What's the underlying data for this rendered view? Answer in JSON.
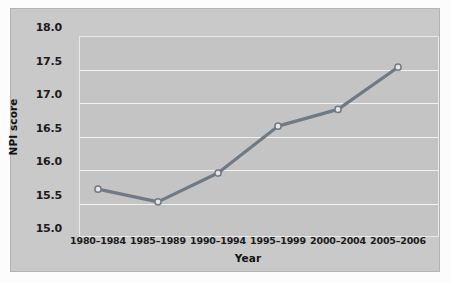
{
  "chart_data": {
    "type": "line",
    "title": "",
    "xlabel": "Year",
    "ylabel": "NPI score",
    "categories": [
      "1980–1984",
      "1985–1989",
      "1990–1994",
      "1995–1999",
      "2000–2004",
      "2005–2006"
    ],
    "values": [
      15.58,
      15.39,
      15.82,
      16.52,
      16.77,
      17.4
    ],
    "series": [
      {
        "name": "NPI score",
        "values": [
          15.58,
          15.39,
          15.82,
          16.52,
          16.77,
          17.4
        ]
      }
    ],
    "ylim": [
      15.0,
      18.0
    ],
    "ytick_labels": [
      "15.0",
      "15.5",
      "16.0",
      "16.5",
      "17.0",
      "17.5",
      "18.0"
    ],
    "ytick_values": [
      15.0,
      15.5,
      16.0,
      16.5,
      17.0,
      17.5,
      18.0
    ],
    "grid": "horizontal",
    "legend": "none",
    "marker": "circle-open",
    "colors": {
      "line": "#6f7a85",
      "marker_fill": "#e6e6e6",
      "marker_edge": "#6f7a85",
      "plot_background": "#c4c4c4",
      "panel_background": "#c9c9c9",
      "gridline": "#f2f2f2",
      "text": "#1b1b1b"
    }
  }
}
